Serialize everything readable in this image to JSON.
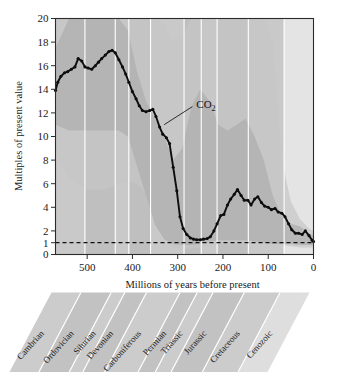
{
  "figure": {
    "kind": "scientific-figure",
    "series_label": "CO2",
    "series_label_display": "CO",
    "series_label_sub": "2"
  },
  "axes": {
    "ylabel": "Multiples of present value",
    "xlabel": "Millions of years before present",
    "y_ticks": [
      0,
      1,
      2,
      4,
      6,
      8,
      10,
      12,
      14,
      16,
      18,
      20
    ],
    "x_ticks": [
      500,
      400,
      300,
      200,
      100,
      0
    ],
    "reference_line_value": 1
  },
  "periods": [
    {
      "name": "Cambrian",
      "start": 570,
      "end": 505
    },
    {
      "name": "Ordovician",
      "start": 505,
      "end": 438
    },
    {
      "name": "Silurian",
      "start": 438,
      "end": 408
    },
    {
      "name": "Devonian",
      "start": 408,
      "end": 360
    },
    {
      "name": "Carboniferous",
      "start": 360,
      "end": 286
    },
    {
      "name": "Permian",
      "start": 286,
      "end": 248
    },
    {
      "name": "Triassic",
      "start": 248,
      "end": 213
    },
    {
      "name": "Jurassic",
      "start": 213,
      "end": 144
    },
    {
      "name": "Cretaceous",
      "start": 144,
      "end": 65
    },
    {
      "name": "Cenozoic",
      "start": 65,
      "end": 0
    }
  ],
  "chart_data": {
    "type": "line",
    "title": "",
    "xlabel": "Millions of years before present",
    "ylabel": "Multiples of present value",
    "xlim": [
      570,
      0
    ],
    "ylim": [
      0,
      20
    ],
    "x_reversed": true,
    "grid": false,
    "legend": "none",
    "annotations": [
      {
        "text": "CO2",
        "x": 250,
        "y": 12.7,
        "points_to_x": 330,
        "points_to_y": 11.0
      }
    ],
    "reference_lines": [
      {
        "y": 1,
        "style": "dashed",
        "label": "present value"
      }
    ],
    "series": [
      {
        "name": "CO2",
        "units": "multiples of present atmospheric value",
        "x": [
          570,
          565,
          558,
          550,
          543,
          535,
          527,
          520,
          512,
          505,
          498,
          490,
          482,
          475,
          468,
          460,
          452,
          445,
          438,
          430,
          422,
          415,
          408,
          400,
          392,
          385,
          378,
          370,
          362,
          355,
          348,
          340,
          333,
          325,
          318,
          310,
          302,
          295,
          288,
          280,
          272,
          265,
          258,
          250,
          243,
          235,
          228,
          220,
          213,
          205,
          198,
          190,
          183,
          175,
          168,
          160,
          153,
          145,
          138,
          130,
          123,
          115,
          108,
          100,
          93,
          85,
          78,
          70,
          63,
          55,
          48,
          40,
          33,
          25,
          18,
          10,
          3,
          0
        ],
        "values": [
          13.9,
          14.6,
          15.1,
          15.4,
          15.5,
          15.7,
          15.9,
          16.6,
          16.4,
          15.9,
          15.8,
          15.7,
          16.0,
          16.3,
          16.6,
          16.9,
          17.2,
          17.3,
          17.1,
          16.5,
          15.9,
          15.3,
          14.6,
          13.8,
          13.2,
          12.6,
          12.2,
          12.1,
          12.2,
          12.3,
          11.7,
          10.8,
          10.2,
          9.9,
          9.4,
          7.4,
          5.4,
          3.2,
          2.2,
          1.7,
          1.4,
          1.3,
          1.25,
          1.25,
          1.3,
          1.35,
          1.5,
          2.0,
          2.6,
          3.3,
          3.4,
          4.2,
          4.7,
          5.1,
          5.5,
          5.0,
          4.6,
          4.6,
          4.2,
          4.7,
          4.9,
          4.4,
          4.1,
          4.0,
          3.8,
          3.9,
          3.6,
          3.5,
          3.2,
          2.6,
          2.1,
          1.8,
          1.8,
          1.7,
          2.0,
          1.6,
          1.2,
          1.1
        ]
      }
    ],
    "uncertainty_bands": [
      {
        "name": "outer-range",
        "x": [
          570,
          540,
          500,
          460,
          430,
          410,
          390,
          370,
          350,
          330,
          310,
          290,
          270,
          250,
          230,
          210,
          190,
          170,
          150,
          130,
          110,
          90,
          70,
          50,
          30,
          10,
          0
        ],
        "upper": [
          20.0,
          20.0,
          20.0,
          20.0,
          20.0,
          20.0,
          20.0,
          20.0,
          20.0,
          19.5,
          18.0,
          18.5,
          20.0,
          20.0,
          20.0,
          20.0,
          20.0,
          20.0,
          20.0,
          20.0,
          20.0,
          18.0,
          8.0,
          4.5,
          3.0,
          2.2,
          2.0
        ],
        "lower": [
          8.5,
          6.5,
          5.5,
          5.5,
          6.0,
          6.2,
          6.0,
          5.2,
          3.5,
          1.8,
          0.6,
          0.5,
          0.5,
          0.6,
          0.8,
          0.9,
          0.9,
          0.9,
          0.9,
          0.9,
          0.9,
          0.9,
          0.8,
          0.7,
          0.6,
          0.6,
          0.6
        ]
      },
      {
        "name": "inner-range",
        "x": [
          570,
          540,
          500,
          460,
          430,
          410,
          390,
          370,
          350,
          330,
          310,
          290,
          270,
          250,
          230,
          210,
          190,
          170,
          150,
          130,
          110,
          90,
          70,
          50,
          30,
          10,
          0
        ],
        "upper": [
          17.5,
          20.0,
          20.0,
          20.0,
          20.0,
          19.0,
          15.5,
          13.0,
          11.5,
          10.0,
          8.0,
          9.0,
          12.5,
          14.0,
          13.0,
          11.0,
          10.5,
          11.0,
          11.5,
          10.0,
          8.0,
          5.0,
          3.2,
          2.6,
          2.4,
          1.8,
          1.6
        ],
        "lower": [
          11.0,
          10.5,
          10.5,
          10.5,
          10.5,
          10.0,
          7.5,
          5.0,
          2.5,
          1.3,
          0.9,
          0.8,
          0.8,
          0.9,
          1.1,
          1.2,
          1.2,
          1.2,
          1.2,
          1.1,
          1.0,
          0.9,
          0.9,
          0.9,
          0.8,
          0.8,
          0.8
        ]
      }
    ]
  },
  "colors": {
    "band_outer": "#c6c6c6",
    "band_inner": "#b0b0b0",
    "curve": "#0d0d0d",
    "axis": "#2b2b2b",
    "divider": "#ffffff",
    "cenozoic_panel": "#e4e4e4"
  }
}
